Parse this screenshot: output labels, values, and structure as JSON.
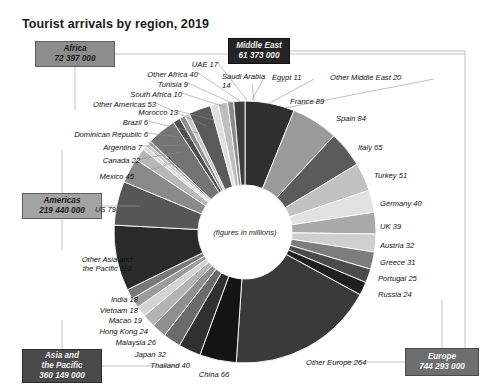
{
  "title": "Tourist arrivals by region, 2019",
  "center_note": "(figures in millions)",
  "regions": [
    {
      "name": "Africa",
      "value": "72 397 000",
      "color": "#8d8d8d",
      "text": "#1a1a1a"
    },
    {
      "name": "Middle East",
      "value": "61 373 000",
      "color": "#232323",
      "text": "#f2f2f2"
    },
    {
      "name": "Americas",
      "value": "219 440 000",
      "color": "#a3a3a3",
      "text": "#1a1a1a"
    },
    {
      "name": "Asia and\nthe Pacific",
      "value": "360 149 000",
      "color": "#4a4a4a",
      "text": "#f2f2f2"
    },
    {
      "name": "Europe",
      "value": "744 293 000",
      "color": "#6e6e6e",
      "text": "#f7f7f7"
    }
  ],
  "region_boxes": [
    {
      "id": "africa",
      "line1": "Africa",
      "line2": "72 397 000"
    },
    {
      "id": "middle-east",
      "line1": "Middle East",
      "line2": "61 373 000"
    },
    {
      "id": "americas",
      "line1": "Americas",
      "line2": "219 440 000"
    },
    {
      "id": "asia-pacific",
      "line1": "Asia and",
      "line1b": "the Pacific",
      "line2": "360 149 000"
    },
    {
      "id": "europe",
      "line1": "Europe",
      "line2": "744 293 000"
    }
  ],
  "chart_data": {
    "type": "pie",
    "title": "Tourist arrivals by region, 2019",
    "subtitle": "(figures in millions)",
    "unit": "millions of arrivals",
    "legend": "none",
    "grid": false,
    "region_totals": {
      "Africa": 72.397,
      "Middle East": 61.373,
      "Americas": 219.44,
      "Asia and the Pacific": 360.149,
      "Europe": 744.293
    },
    "categories": [
      "France",
      "Spain",
      "Italy",
      "Turkey",
      "Germany",
      "UK",
      "Austria",
      "Greece",
      "Portugal",
      "Russia",
      "Other Europe",
      "China",
      "Thailand",
      "Japan",
      "Malaysia",
      "Hong Kong",
      "Macao",
      "Vietnam",
      "India",
      "Other Asia and the Pacific",
      "US",
      "Mexico",
      "Canada",
      "Argentina",
      "Dominican Republic",
      "Brazil",
      "Other Americas",
      "Morocco",
      "South Africa",
      "Tunisia",
      "Other Africa",
      "Saudi Arabia",
      "UAE",
      "Egypt",
      "Other Middle East"
    ],
    "values": [
      89,
      84,
      65,
      51,
      40,
      39,
      32,
      31,
      25,
      24,
      264,
      66,
      40,
      32,
      26,
      24,
      19,
      18,
      18,
      118,
      79,
      45,
      22,
      7,
      6,
      6,
      53,
      13,
      10,
      9,
      40,
      14,
      17,
      11,
      20
    ],
    "region_of": [
      "Europe",
      "Europe",
      "Europe",
      "Europe",
      "Europe",
      "Europe",
      "Europe",
      "Europe",
      "Europe",
      "Europe",
      "Europe",
      "Asia and the Pacific",
      "Asia and the Pacific",
      "Asia and the Pacific",
      "Asia and the Pacific",
      "Asia and the Pacific",
      "Asia and the Pacific",
      "Asia and the Pacific",
      "Asia and the Pacific",
      "Asia and the Pacific",
      "Americas",
      "Americas",
      "Americas",
      "Americas",
      "Americas",
      "Americas",
      "Americas",
      "Africa",
      "Africa",
      "Africa",
      "Africa",
      "Middle East",
      "Middle East",
      "Middle East",
      "Middle East"
    ],
    "colors": [
      "#2f2f2f",
      "#9a9a9a",
      "#5b5b5b",
      "#c2c2c2",
      "#e2e2e2",
      "#a9a9a9",
      "#cfcfcf",
      "#7d7d7d",
      "#4b4b4b",
      "#1f1f1f",
      "#3a3a3a",
      "#141414",
      "#303030",
      "#6b6b6b",
      "#8f8f8f",
      "#b4b4b4",
      "#d4d4d4",
      "#9c9c9c",
      "#787878",
      "#2a2a2a",
      "#565656",
      "#8a8a8a",
      "#b8b8b8",
      "#dcdcdc",
      "#c6c6c6",
      "#a0a0a0",
      "#747474",
      "#4f4f4f",
      "#8e8e8e",
      "#c9c9c9",
      "#5a5a5a",
      "#dedede",
      "#bfbfbf",
      "#8b8b8b",
      "#3d3d3d"
    ]
  },
  "labels": [
    {
      "id": "uae",
      "text": "UAE 17"
    },
    {
      "id": "other-africa",
      "text": "Other Africa 40"
    },
    {
      "id": "tunisia",
      "text": "Tunisia 9"
    },
    {
      "id": "south-africa",
      "text": "South Africa 10"
    },
    {
      "id": "morocco",
      "text": "Morocco 13"
    },
    {
      "id": "other-americas",
      "text": "Other Americas 53"
    },
    {
      "id": "brazil",
      "text": "Brazil 6"
    },
    {
      "id": "dominican-republic",
      "text": "Dominican Republic 6"
    },
    {
      "id": "argentina",
      "text": "Argentina 7"
    },
    {
      "id": "canada",
      "text": "Canada 22"
    },
    {
      "id": "mexico",
      "text": "Mexico 45"
    },
    {
      "id": "us",
      "text": "US 79"
    },
    {
      "id": "other-asia-pacific-1",
      "text": "Other Asia and"
    },
    {
      "id": "other-asia-pacific-2",
      "text": "the Pacific 118"
    },
    {
      "id": "india",
      "text": "India 18"
    },
    {
      "id": "vietnam",
      "text": "Vietnam 18"
    },
    {
      "id": "macao",
      "text": "Macao 19"
    },
    {
      "id": "hong-kong",
      "text": "Hong Kong 24"
    },
    {
      "id": "malaysia",
      "text": "Malaysia 26"
    },
    {
      "id": "japan",
      "text": "Japan 32"
    },
    {
      "id": "thailand",
      "text": "Thailand 40"
    },
    {
      "id": "china",
      "text": "China 66"
    },
    {
      "id": "other-europe",
      "text": "Other Europe 264"
    },
    {
      "id": "russia",
      "text": "Russia 24"
    },
    {
      "id": "portugal",
      "text": "Portugal 25"
    },
    {
      "id": "greece",
      "text": "Greece 31"
    },
    {
      "id": "austria",
      "text": "Austria 32"
    },
    {
      "id": "uk",
      "text": "UK 39"
    },
    {
      "id": "germany",
      "text": "Germany 40"
    },
    {
      "id": "turkey",
      "text": "Turkey 51"
    },
    {
      "id": "italy",
      "text": "Italy 65"
    },
    {
      "id": "spain",
      "text": "Spain 84"
    },
    {
      "id": "france",
      "text": "France 89"
    },
    {
      "id": "saudi-arabia-1",
      "text": "Saudi Arabia"
    },
    {
      "id": "saudi-arabia-2",
      "text": "14"
    },
    {
      "id": "egypt",
      "text": "Egypt 11"
    },
    {
      "id": "other-middle-east",
      "text": "Other Middle East 20"
    }
  ]
}
